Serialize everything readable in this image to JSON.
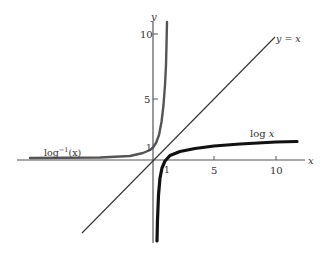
{
  "figure": {
    "type": "function-graph",
    "axes": {
      "x_label": "x",
      "y_label": "y",
      "x_ticks": [
        {
          "value": 1,
          "label": "1"
        },
        {
          "value": 5,
          "label": "5"
        },
        {
          "value": 10,
          "label": "10"
        }
      ],
      "y_ticks": [
        {
          "value": 1,
          "label": "1"
        },
        {
          "value": 5,
          "label": "5"
        },
        {
          "value": 10,
          "label": "10"
        }
      ]
    },
    "curves": [
      {
        "name": "identity",
        "label": "y = x",
        "style": "thin line"
      },
      {
        "name": "log",
        "label": "log x",
        "style": "thick black"
      },
      {
        "name": "inverse-log",
        "label": "log⁻¹(x)",
        "style": "medium gray"
      }
    ],
    "labels": {
      "identity": "y = x",
      "log": "log x",
      "inverse_log_prefix": "log",
      "inverse_log_sup": "−1",
      "inverse_log_arg": "(x)",
      "x_axis": "x",
      "y_axis": "y",
      "tick_x_1": "1",
      "tick_x_5": "5",
      "tick_x_10": "10",
      "tick_y_1": "1",
      "tick_y_5": "5",
      "tick_y_10": "10"
    },
    "colors": {
      "axis": "#555555",
      "log_curve": "#111111",
      "exp_curve": "#555555",
      "identity_line": "#333333"
    }
  }
}
